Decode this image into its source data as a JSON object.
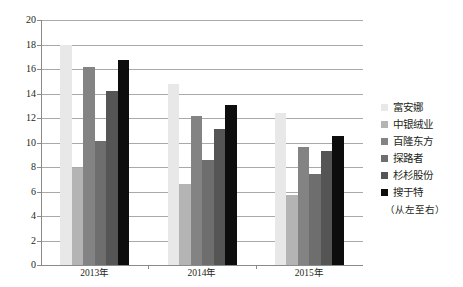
{
  "chart_data": {
    "type": "bar",
    "title": "",
    "subtitle": "",
    "xlabel": "",
    "ylabel": "",
    "categories": [
      "2013年",
      "2014年",
      "2015年"
    ],
    "series": [
      {
        "name": "富安娜",
        "color": "#e8e8e8",
        "values": [
          18.0,
          14.8,
          12.4
        ]
      },
      {
        "name": "中银绒业",
        "color": "#b4b4b4",
        "values": [
          7.9,
          6.6,
          5.7
        ]
      },
      {
        "name": "百隆东方",
        "color": "#838383",
        "values": [
          16.2,
          12.2,
          9.6
        ]
      },
      {
        "name": "探路者",
        "color": "#6e6e6e",
        "values": [
          10.1,
          8.6,
          7.4
        ]
      },
      {
        "name": "杉杉股份",
        "color": "#555555",
        "values": [
          14.2,
          11.1,
          9.3
        ]
      },
      {
        "name": "搜于特",
        "color": "#0d0d0d",
        "values": [
          16.7,
          13.1,
          10.5
        ]
      }
    ],
    "ylim": [
      0,
      20
    ],
    "ytick_step": 2,
    "ytick_labels": [
      "0",
      "2",
      "4",
      "6",
      "8",
      "10",
      "12",
      "14",
      "16",
      "18",
      "20"
    ],
    "grid": true,
    "grid_axis": "y",
    "legend_position": "right",
    "legend_note": "（从左至右）"
  }
}
